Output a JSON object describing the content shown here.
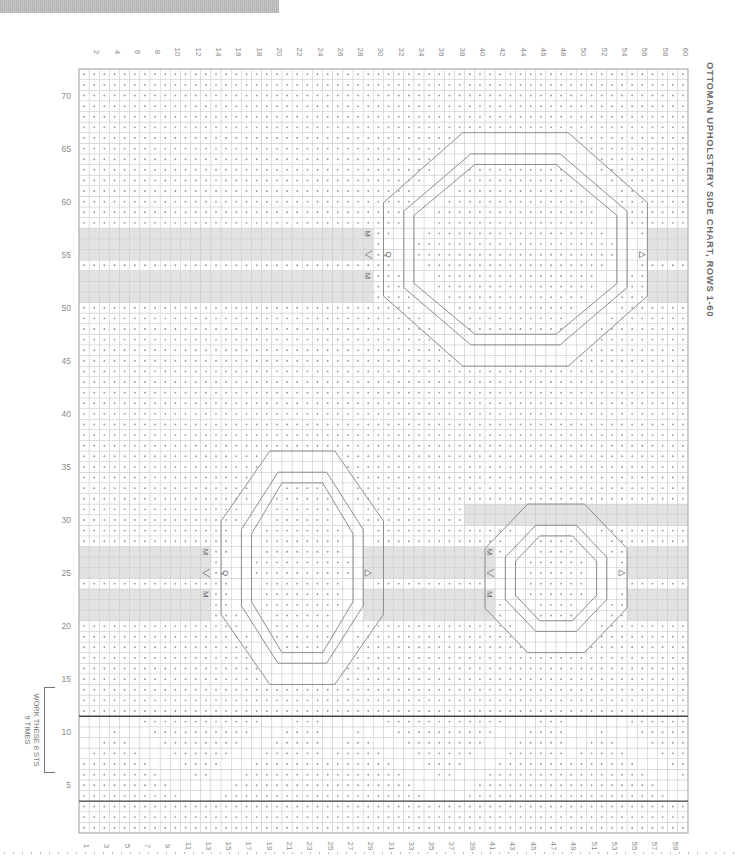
{
  "title": "OTTOMAN UPHOLSTERY SIDE CHART, ROWS 1-60",
  "repeat_note": {
    "line1": "WORK THESE 8 STS",
    "line2": "9 TIMES"
  },
  "chart_data": {
    "type": "diagram",
    "subtype": "knitting-chart",
    "title": "OTTOMAN UPHOLSTERY SIDE CHART, ROWS 1-60",
    "columns": 60,
    "rows": 72,
    "column_labels_top": [
      "2",
      "4",
      "6",
      "8",
      "10",
      "12",
      "14",
      "16",
      "18",
      "20",
      "22",
      "24",
      "26",
      "28",
      "30",
      "32",
      "34",
      "36",
      "38",
      "40",
      "42",
      "44",
      "46",
      "48",
      "50",
      "52",
      "54",
      "56",
      "58",
      "60"
    ],
    "column_labels_bottom": [
      "1",
      "3",
      "5",
      "7",
      "9",
      "11",
      "13",
      "15",
      "17",
      "19",
      "21",
      "23",
      "25",
      "27",
      "29",
      "31",
      "33",
      "35",
      "37",
      "39",
      "41",
      "43",
      "45",
      "47",
      "49",
      "51",
      "53",
      "55",
      "57",
      "59"
    ],
    "row_labels": [
      "5",
      "10",
      "15",
      "20",
      "25",
      "30",
      "35",
      "40",
      "45",
      "50",
      "55",
      "60",
      "65",
      "70"
    ],
    "repeat_rows": {
      "from": 4,
      "to": 11,
      "label": "WORK THESE 8 STS 9 TIMES"
    },
    "gray_bands": [
      {
        "rows": [
          51,
          53
        ],
        "cols": [
          1,
          29
        ]
      },
      {
        "rows": [
          55,
          57
        ],
        "cols": [
          1,
          29
        ]
      },
      {
        "rows": [
          51,
          53
        ],
        "cols": [
          57,
          60
        ]
      },
      {
        "rows": [
          55,
          57
        ],
        "cols": [
          57,
          60
        ]
      },
      {
        "rows": [
          21,
          23
        ],
        "cols": [
          1,
          13
        ]
      },
      {
        "rows": [
          25,
          27
        ],
        "cols": [
          1,
          13
        ]
      },
      {
        "rows": [
          21,
          23
        ],
        "cols": [
          29,
          41
        ]
      },
      {
        "rows": [
          25,
          27
        ],
        "cols": [
          29,
          41
        ]
      },
      {
        "rows": [
          21,
          23
        ],
        "cols": [
          55,
          60
        ]
      },
      {
        "rows": [
          25,
          27
        ],
        "cols": [
          55,
          60
        ]
      },
      {
        "rows": [
          30,
          31
        ],
        "cols": [
          39,
          60
        ]
      }
    ],
    "motifs": [
      {
        "name": "large-oval-top",
        "rows": [
          45,
          66
        ],
        "cols": [
          31,
          56
        ]
      },
      {
        "name": "large-oval-left",
        "rows": [
          15,
          36
        ],
        "cols": [
          15,
          30
        ]
      },
      {
        "name": "small-oval-right",
        "rows": [
          18,
          31
        ],
        "cols": [
          41,
          54
        ]
      }
    ],
    "special_symbols": [
      {
        "symbol": "M",
        "row": 57,
        "col": 29
      },
      {
        "symbol": "M",
        "row": 53,
        "col": 29
      },
      {
        "symbol": "<",
        "row": 55,
        "col": 29
      },
      {
        "symbol": "Q",
        "row": 55,
        "col": 31
      },
      {
        "symbol": "triangle",
        "row": 55,
        "col": 56
      },
      {
        "symbol": "M",
        "row": 27,
        "col": 13
      },
      {
        "symbol": "M",
        "row": 23,
        "col": 13
      },
      {
        "symbol": "<",
        "row": 25,
        "col": 13
      },
      {
        "symbol": "Q",
        "row": 25,
        "col": 15
      },
      {
        "symbol": "triangle",
        "row": 25,
        "col": 29
      },
      {
        "symbol": "M",
        "row": 27,
        "col": 41
      },
      {
        "symbol": "M",
        "row": 23,
        "col": 41
      },
      {
        "symbol": "<",
        "row": 25,
        "col": 41
      },
      {
        "symbol": "triangle",
        "row": 25,
        "col": 54
      }
    ]
  }
}
